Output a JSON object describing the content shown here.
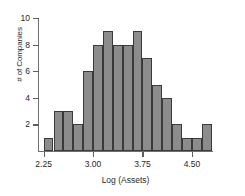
{
  "chart_data": {
    "type": "bar",
    "title": "",
    "xlabel": "Log (Assets)",
    "ylabel": "# of Companies",
    "categories": [
      "2.30",
      "2.45",
      "2.60",
      "2.75",
      "2.90",
      "3.05",
      "3.20",
      "3.35",
      "3.50",
      "3.65",
      "3.80",
      "3.95",
      "4.10",
      "4.25",
      "4.40",
      "4.55",
      "4.70"
    ],
    "values": [
      1,
      3,
      3,
      2,
      6,
      8,
      9,
      8,
      8,
      9,
      7,
      5,
      4,
      2,
      1,
      1,
      2
    ],
    "bin_edges": [
      2.25,
      2.4,
      2.55,
      2.7,
      2.85,
      3.0,
      3.15,
      3.3,
      3.45,
      3.6,
      3.75,
      3.9,
      4.05,
      4.2,
      4.35,
      4.5,
      4.65,
      4.8
    ],
    "bin_width": 0.15,
    "xlim": [
      2.18,
      4.82
    ],
    "ylim": [
      0,
      10
    ],
    "x_ticks": [
      2.25,
      3.0,
      3.75,
      4.5
    ],
    "x_tick_labels": [
      "2.25",
      "3.00",
      "3.75",
      "4.50"
    ],
    "y_ticks": [
      2,
      4,
      6,
      8,
      10
    ],
    "y_tick_labels": [
      "2",
      "4",
      "6",
      "8",
      "10"
    ],
    "grid": false,
    "legend": null,
    "bar_color": "#8c8c8c",
    "bar_edge_color": "#3a3a3a",
    "axis_color": "#707070",
    "text_color": "#1f1f1f",
    "background": "#ffffff"
  }
}
